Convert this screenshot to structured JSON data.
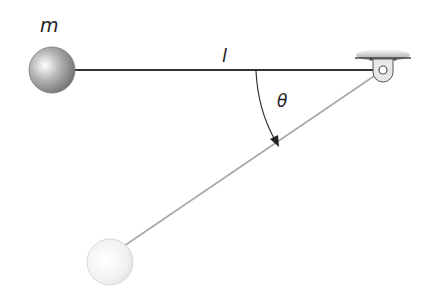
{
  "diagram": {
    "labels": {
      "mass": "m",
      "length": "l",
      "angle": "θ"
    },
    "elements": {
      "pivot": {
        "x": 383,
        "y": 70
      },
      "mass_initial": {
        "x": 52,
        "y": 70,
        "r": 23,
        "color": "#8a8a8a"
      },
      "mass_final": {
        "x": 110,
        "y": 262,
        "r": 23,
        "color": "#e6e6e6"
      },
      "rod_color": "#333333",
      "rod_final_color": "#9a9a9a"
    }
  }
}
